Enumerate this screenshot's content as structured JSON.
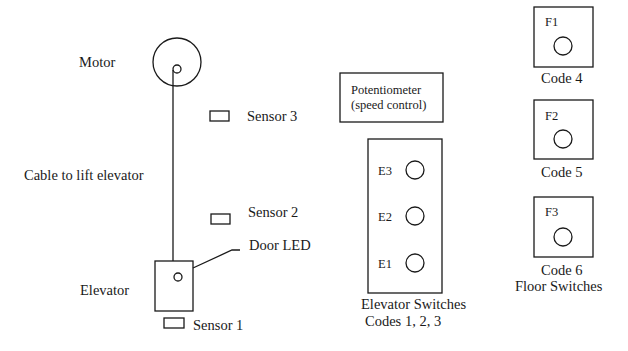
{
  "diagram": {
    "type": "elevator-system-schematic",
    "left_shaft": {
      "motor": {
        "label": "Motor"
      },
      "cable": {
        "label": "Cable to lift elevator"
      },
      "elevator": {
        "label": "Elevator"
      },
      "door_led": {
        "label": "Door LED"
      },
      "sensors": [
        {
          "label": "Sensor 3"
        },
        {
          "label": "Sensor 2"
        },
        {
          "label": "Sensor 1"
        }
      ]
    },
    "potentiometer": {
      "line1": "Potentiometer",
      "line2": "(speed control)"
    },
    "elevator_switches": {
      "buttons": [
        {
          "label": "E3"
        },
        {
          "label": "E2"
        },
        {
          "label": "E1"
        }
      ],
      "caption1": "Elevator Switches",
      "caption2": "Codes 1, 2, 3"
    },
    "floor_switches": {
      "panels": [
        {
          "label": "F1",
          "code": "Code 4"
        },
        {
          "label": "F2",
          "code": "Code 5"
        },
        {
          "label": "F3",
          "code": "Code 6"
        }
      ],
      "caption": "Floor Switches"
    }
  }
}
